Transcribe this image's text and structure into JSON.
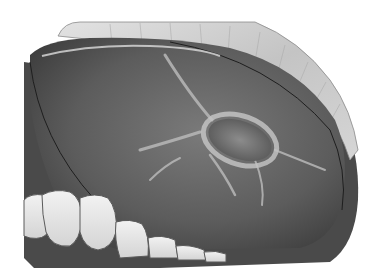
{
  "image": {
    "description": "Grayscale medical illustration of an oral cavity showing a palatal bony lesion with radiating trabecular ridges, lip tissue at top and a row of lower teeth at bottom-left",
    "palette": {
      "background": "#ffffff",
      "lip_tissue": "#c9c9c9",
      "outer_tissue_dark": "#4a4a4a",
      "palate_mid": "#6a6a6a",
      "palate_dark": "#3e3e3e",
      "highlight_ridge": "#b8b8b8",
      "lesion": "#7a7a7a",
      "teeth": "#e8e8e8",
      "outline": "#1e1e1e"
    },
    "regions": [
      {
        "name": "lip-tissue",
        "label": "Upper lip tissue"
      },
      {
        "name": "palate",
        "label": "Palate surface"
      },
      {
        "name": "lesion",
        "label": "Central bony lesion"
      },
      {
        "name": "teeth-row",
        "label": "Lower teeth"
      }
    ]
  }
}
